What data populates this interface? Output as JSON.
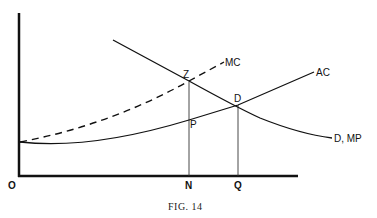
{
  "figure": {
    "caption": "FIG. 14",
    "origin_label": "O",
    "x_ticks": [
      "N",
      "Q"
    ],
    "curves": {
      "mc": "MC",
      "ac": "AC",
      "demand": "D, MP"
    },
    "points": {
      "z": "Z",
      "d": "D",
      "p": "P"
    }
  }
}
